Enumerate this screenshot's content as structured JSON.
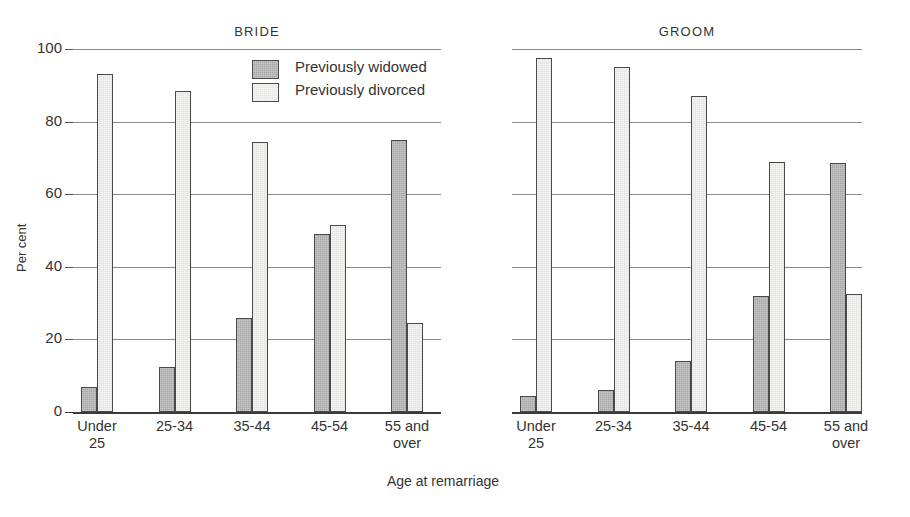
{
  "figure": {
    "width": 910,
    "height": 517,
    "background": "#ffffff",
    "ink_color": "#333333"
  },
  "legend": {
    "position": "inside-top-left-of-bride-panel",
    "entries": [
      {
        "label": "Previously widowed",
        "key": "widowed",
        "swatch_color": "#a8a8a8"
      },
      {
        "label": "Previously divorced",
        "key": "divorced",
        "swatch_color": "#e3e3e1"
      }
    ]
  },
  "chart_data": {
    "type": "bar",
    "title": "",
    "xlabel": "Age at remarriage",
    "ylabel": "Per cent",
    "ylim": [
      0,
      100
    ],
    "yticks": [
      0,
      20,
      40,
      60,
      80,
      100
    ],
    "ytick_labels": [
      "0",
      "20",
      "40",
      "60",
      "80",
      "100"
    ],
    "grid": "horizontal",
    "categories": [
      "Under 25",
      "25-34",
      "35-44",
      "45-54",
      "55 and over"
    ],
    "category_lines": [
      [
        "Under",
        "25"
      ],
      [
        "25-34",
        ""
      ],
      [
        "35-44",
        ""
      ],
      [
        "45-54",
        ""
      ],
      [
        "55 and",
        "over"
      ]
    ],
    "panels": [
      {
        "name": "BRIDE",
        "series": [
          {
            "name": "Previously widowed",
            "key": "widowed",
            "values": [
              7,
              12.5,
              26,
              49,
              75
            ]
          },
          {
            "name": "Previously divorced",
            "key": "divorced",
            "values": [
              93,
              88.5,
              74.5,
              51.5,
              24.5
            ]
          }
        ]
      },
      {
        "name": "GROOM",
        "series": [
          {
            "name": "Previously widowed",
            "key": "widowed",
            "values": [
              4.5,
              6,
              14,
              32,
              68.5
            ]
          },
          {
            "name": "Previously divorced",
            "key": "divorced",
            "values": [
              97.5,
              95,
              87,
              69,
              32.5
            ]
          }
        ]
      }
    ]
  }
}
